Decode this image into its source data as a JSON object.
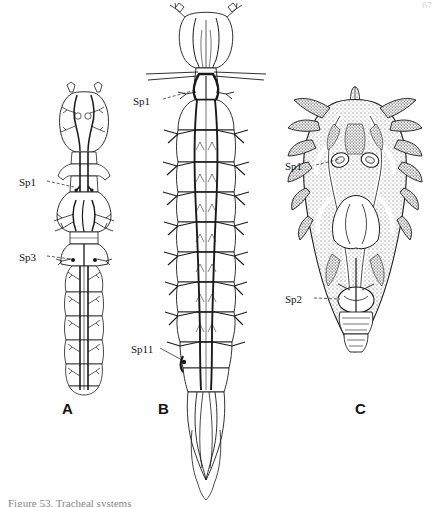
{
  "plate": {
    "background_color": "#fefefe",
    "ink_color": "#1a1a1a",
    "shading_color": "#9a9a9a",
    "caption_text": "Figure 53.  Tracheal systems",
    "corner_mark": "67"
  },
  "panels": [
    {
      "letter": "A",
      "name": "panel-a",
      "description": "first instar larva tracheal system, outline drawing",
      "annotations": [
        {
          "name": "sp1",
          "label": "Sp1"
        },
        {
          "name": "sp3",
          "label": "Sp3"
        }
      ]
    },
    {
      "letter": "B",
      "name": "panel-b",
      "description": "mature larva tracheal system, outline drawing",
      "annotations": [
        {
          "name": "sp1",
          "label": "Sp1"
        },
        {
          "name": "sp11",
          "label": "Sp11"
        }
      ]
    },
    {
      "letter": "C",
      "name": "panel-c",
      "description": "pupa tracheal system, stippled shaded drawing",
      "annotations": [
        {
          "name": "sp1",
          "label": "Sp1"
        },
        {
          "name": "sp2",
          "label": "Sp2"
        }
      ]
    }
  ]
}
